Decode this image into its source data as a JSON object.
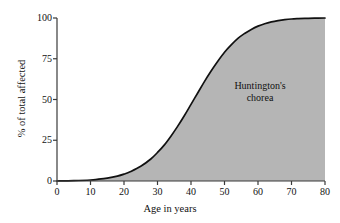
{
  "chart_data": {
    "type": "area",
    "title": "",
    "subtitle": "",
    "xlabel": "Age in years",
    "ylabel": "% of total affected",
    "xlim": [
      0,
      80
    ],
    "ylim": [
      0,
      100
    ],
    "grid": false,
    "legend": null,
    "xticks": [
      0,
      10,
      20,
      30,
      40,
      50,
      60,
      70,
      80
    ],
    "xtick_labels": [
      "0",
      "10",
      "20",
      "30",
      "40",
      "50",
      "60",
      "70",
      "80"
    ],
    "yticks": [
      0,
      25,
      50,
      75,
      100
    ],
    "ytick_labels": [
      "0",
      "25",
      "50",
      "75",
      "100"
    ],
    "annotations": [
      {
        "name": "curve-label",
        "lines": [
          "Huntington's",
          "chorea"
        ],
        "x": 55,
        "y": 52
      }
    ],
    "series": [
      {
        "name": "Huntington's chorea cumulative onset",
        "fill_color": "#b5b5b5",
        "line_color": "#111111",
        "x": [
          0,
          5,
          10,
          12,
          15,
          18,
          20,
          22,
          25,
          28,
          30,
          32,
          34,
          36,
          38,
          40,
          42,
          44,
          46,
          48,
          50,
          52,
          54,
          56,
          58,
          60,
          62,
          64,
          66,
          68,
          70,
          72,
          75,
          78,
          80
        ],
        "values": [
          0,
          0.2,
          0.6,
          1.0,
          1.8,
          3.0,
          4.2,
          5.8,
          9.0,
          13.5,
          17.5,
          22.0,
          27.5,
          33.5,
          40.0,
          47.0,
          54.0,
          61.0,
          67.5,
          73.5,
          79.0,
          83.5,
          87.5,
          90.5,
          93.0,
          95.0,
          96.5,
          97.6,
          98.4,
          99.0,
          99.4,
          99.6,
          99.8,
          99.9,
          100
        ]
      }
    ]
  },
  "axes": {
    "x_title": "Age in years",
    "y_title": "% of total affected"
  },
  "annotation": {
    "line1": "Huntington's",
    "line2": "chorea"
  },
  "colors": {
    "fill": "#b5b5b5",
    "line": "#111111",
    "axis": "#3a3a3a",
    "background": "#ffffff"
  }
}
